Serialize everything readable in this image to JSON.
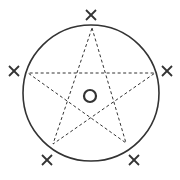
{
  "diagram": {
    "type": "star-in-circle",
    "colors": {
      "stroke": "#333333",
      "background": "#ffffff"
    },
    "circle": {
      "cx": 91,
      "cy": 93,
      "r": 68
    },
    "center_mark": {
      "shape": "ring",
      "cx": 90,
      "cy": 96,
      "r": 6
    },
    "star_points": [
      {
        "name": "top",
        "x": 92,
        "y": 28
      },
      {
        "name": "right",
        "x": 155,
        "y": 73
      },
      {
        "name": "bottom-right",
        "x": 126,
        "y": 143
      },
      {
        "name": "bottom-left",
        "x": 53,
        "y": 144
      },
      {
        "name": "left",
        "x": 28,
        "y": 73
      }
    ],
    "x_marks": [
      {
        "name": "top",
        "x": 91,
        "y": 15
      },
      {
        "name": "right",
        "x": 167,
        "y": 71
      },
      {
        "name": "bottom-right",
        "x": 134,
        "y": 160
      },
      {
        "name": "bottom-left",
        "x": 47,
        "y": 160
      },
      {
        "name": "left",
        "x": 14,
        "y": 71
      }
    ],
    "star_line_style": "dashed",
    "circle_line_style": "solid"
  }
}
